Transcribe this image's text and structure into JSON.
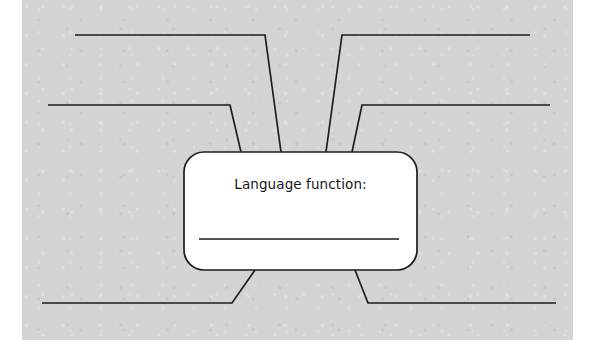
{
  "page": {
    "background_color": "#ffffff",
    "paper_color": "#d4d4d4",
    "ink_color": "#1d1d1d"
  },
  "center_box": {
    "label": "Language function:",
    "answer_line_value": "",
    "shape": "rounded-rectangle",
    "fill_color": "#ffffff",
    "x": 184,
    "y": 152,
    "width": 233,
    "height": 118,
    "corner_radius": 20
  },
  "connectors": [
    {
      "id": "branch-top-left-outer",
      "label_value": "",
      "direction": "up-left",
      "path": "M 75 35 L 265 35 L 281 152"
    },
    {
      "id": "branch-top-left-inner",
      "label_value": "",
      "direction": "up-left",
      "path": "M 48 105 L 230 105 L 241 152"
    },
    {
      "id": "branch-top-right-outer",
      "label_value": "",
      "direction": "up-right",
      "path": "M 530 35 L 342 35 L 326 152"
    },
    {
      "id": "branch-top-right-inner",
      "label_value": "",
      "direction": "up-right",
      "path": "M 550 105 L 362 105 L 352 152"
    },
    {
      "id": "branch-bottom-left",
      "label_value": "",
      "direction": "down-left",
      "path": "M 42 303 L 232 303 L 255 270"
    },
    {
      "id": "branch-bottom-right",
      "label_value": "",
      "direction": "down-right",
      "path": "M 556 303 L 368 303 L 355 270"
    }
  ],
  "answer_blanks": [
    {
      "id": "blank-top-left-outer",
      "value": ""
    },
    {
      "id": "blank-top-left-inner",
      "value": ""
    },
    {
      "id": "blank-top-right-outer",
      "value": ""
    },
    {
      "id": "blank-top-right-inner",
      "value": ""
    },
    {
      "id": "blank-bottom-left",
      "value": ""
    },
    {
      "id": "blank-bottom-right",
      "value": ""
    },
    {
      "id": "blank-center",
      "value": ""
    }
  ]
}
